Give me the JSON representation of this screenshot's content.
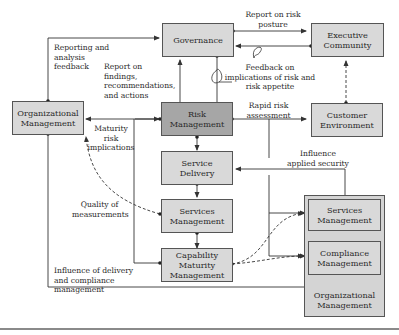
{
  "diagram": {
    "nodes": {
      "governance": {
        "label": "Governance"
      },
      "executive_community": {
        "label": "Executive Community"
      },
      "organizational_management_left": {
        "label": "Organizational Management"
      },
      "risk_management": {
        "label": "Risk Management"
      },
      "customer_environment": {
        "label": "Customer Environment"
      },
      "service_delivery": {
        "label": "Service Delivery"
      },
      "services_management_center": {
        "label": "Services Management"
      },
      "capability_maturity_management": {
        "label": "Capability Maturity Management"
      },
      "organizational_management_group": {
        "label": "Organizational Management"
      },
      "services_management_right": {
        "label": "Services Management"
      },
      "compliance_management": {
        "label": "Compliance Management"
      }
    },
    "edge_labels": {
      "reporting_feedback": "Reporting and analysis feedback",
      "report_findings": "Report on findings, recommendations, and actions",
      "report_risk_posture": "Report on risk posture",
      "feedback_implications": "Feedback on implications of risk and risk appetite",
      "rapid_risk": "Rapid risk assessment",
      "maturity_risk": "Maturity risk implications",
      "influence_security": "Influence applied security",
      "quality_measurements": "Quality of measurements",
      "influence_delivery": "Influence of delivery and compliance management"
    },
    "colors": {
      "box_fill": "#d9d9d9",
      "highlight_fill": "#a6a6a6",
      "line": "#333333"
    }
  }
}
